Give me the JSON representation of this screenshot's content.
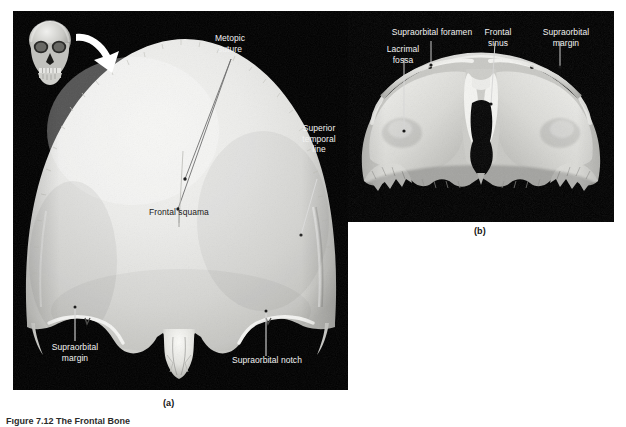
{
  "figure": {
    "background_color": "#ffffff",
    "plate_background": "#000000",
    "bone_color": "#e3e3e0",
    "label_color": "#f2f2f2",
    "caption_color": "#141414"
  },
  "panels": [
    {
      "id": "a",
      "caption": "(a)",
      "view": "anterior view of the frontal bone",
      "inset": {
        "name": "skull-orientation-inset",
        "description": "anterior view of whole skull with arrow indicating frontal bone"
      },
      "labels": [
        {
          "id": "metopic-suture",
          "text": "Metopic\nsuture"
        },
        {
          "id": "superior-temporal-line",
          "text": "Superior\ntemporal\nline"
        },
        {
          "id": "frontal-squama",
          "text": "Frontal squama"
        },
        {
          "id": "supraorbital-margin",
          "text": "Supraorbital\nmargin"
        },
        {
          "id": "supraorbital-notch",
          "text": "Supraorbital notch"
        }
      ]
    },
    {
      "id": "b",
      "caption": "(b)",
      "view": "posterior/inferior view of the frontal bone",
      "labels": [
        {
          "id": "supraorbital-foramen",
          "text": "Supraorbital foramen"
        },
        {
          "id": "lacrimal-fossa",
          "text": "Lacrimal\nfossa"
        },
        {
          "id": "frontal-sinus",
          "text": "Frontal\nsinus"
        },
        {
          "id": "supraorbital-margin-b",
          "text": "Supraorbital\nmargin"
        }
      ]
    }
  ],
  "bottom_caption": "Figure 7.12  The Frontal Bone"
}
